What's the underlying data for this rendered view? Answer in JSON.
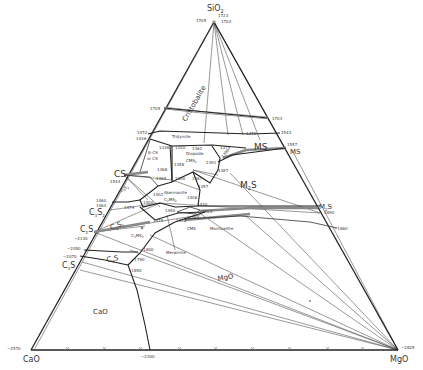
{
  "diagram": {
    "vertices": {
      "top": {
        "label": "SiO",
        "sub": "2",
        "x": 214,
        "y": 22
      },
      "left": {
        "label": "CaO",
        "x": 31,
        "y": 350
      },
      "right": {
        "label": "MgO",
        "x": 398,
        "y": 350
      }
    },
    "vertex_temps": {
      "sio2_left": "1705",
      "sio2_right_1": "1723",
      "sio2_right_2": "1703",
      "cao": "~2570",
      "mgo": "~2825",
      "base_mid": "~2300"
    },
    "phase_fields": [
      {
        "id": "cristobalite",
        "label": "Cristobalite"
      },
      {
        "id": "tridymite",
        "label": "Tridymite"
      },
      {
        "id": "ms",
        "label": "MS"
      },
      {
        "id": "m2s",
        "label": "M",
        "sub": "2",
        "tail": "S"
      },
      {
        "id": "diopside",
        "label": "Diopside"
      },
      {
        "id": "diopside_formula",
        "label": "CMS",
        "sub": "2"
      },
      {
        "id": "akermanite",
        "label": "Akermanite"
      },
      {
        "id": "akermanite_formula",
        "label": "C",
        "sub": "2",
        "tail": "MS",
        "sub2": "2"
      },
      {
        "id": "monticellite",
        "label": "Monticellite"
      },
      {
        "id": "cms",
        "label": "CMS"
      },
      {
        "id": "merwinite",
        "label": "Merwinite"
      },
      {
        "id": "c3ms2",
        "label": "C",
        "sub": "3",
        "tail": "MS",
        "sub2": "2"
      },
      {
        "id": "c2s_field",
        "label": "C",
        "sub": "2",
        "tail": "S"
      },
      {
        "id": "c3s_field",
        "label": "C",
        "sub": "3",
        "tail": "S"
      },
      {
        "id": "mgo_field",
        "label": "MgO"
      },
      {
        "id": "cao_field",
        "label": "CaO"
      },
      {
        "id": "beta_cs",
        "label": "β–CS"
      },
      {
        "id": "alpha_cs",
        "label": "or CS"
      },
      {
        "id": "c3s2_field",
        "label": "C",
        "sub": "3",
        "tail": "S",
        "sub2": "2"
      }
    ],
    "edge_compounds": {
      "cs": {
        "label": "CS",
        "temp": "1544"
      },
      "c3s2": {
        "label": "C",
        "sub": "3",
        "tail": "S",
        "sub2": "2",
        "temp1": "1460",
        "temp2": "1464"
      },
      "c2s": {
        "label": "C",
        "sub": "2",
        "tail": "S",
        "temp": "~2130"
      },
      "c3s": {
        "label": "C",
        "sub": "3",
        "tail": "S",
        "temp1": "~2050",
        "temp2": "~2070"
      },
      "ms_edge": {
        "label": "MS",
        "temp": "1557"
      },
      "m2s_edge": {
        "label": "M",
        "sub": "2",
        "tail": "S",
        "temp": "1890"
      }
    },
    "temperatures": {
      "t1705_edge": "1705",
      "t1703_edge": "1703",
      "t1470": "1470",
      "t1436": "1436",
      "t1470b": "1470",
      "t1543": "1543",
      "t1336": "1336",
      "t1320": "1320",
      "t1362": "1362",
      "t1375": "1375",
      "t1390": "1390",
      "t1391": "1391",
      "t1358": "1358",
      "t1368": "1368",
      "t1365": "1365",
      "t1350": "1350",
      "t1367": "1367",
      "t1387": "1387",
      "t1357": "1357",
      "t1402": "1402",
      "t1406": "1406",
      "t1430": "1430",
      "t1400": "1400",
      "t1479": "1479",
      "t1490": "1490",
      "t1503": "1503",
      "t1575": "1575",
      "t1498": "1498",
      "t1460b": "1460",
      "t1800": "~1800",
      "t1790": "~1790",
      "t1850": "~1850",
      "t1860": "~1860"
    },
    "colors": {
      "line": "#222222",
      "tie_line": "#444444",
      "double_band": "#888888",
      "text": "#333333",
      "background": "#ffffff"
    }
  }
}
